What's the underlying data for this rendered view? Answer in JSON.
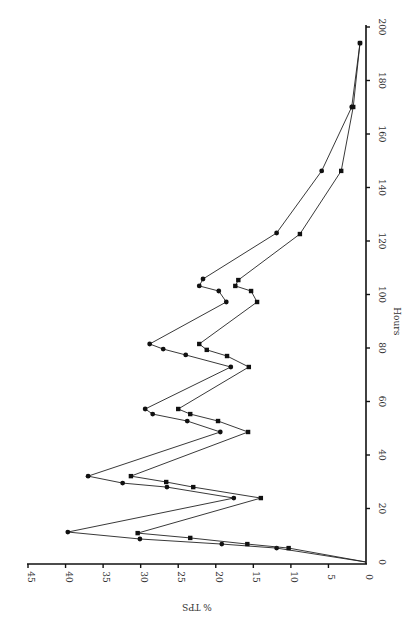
{
  "chart_data": {
    "type": "line",
    "orientation": "rotated-90-ccw",
    "title": "",
    "xlabel": "Hours",
    "ylabel": "% TPS",
    "xlim": [
      0,
      200
    ],
    "ylim": [
      0,
      45
    ],
    "x_ticks": [
      0,
      20,
      40,
      60,
      80,
      100,
      120,
      140,
      160,
      180,
      200
    ],
    "y_ticks": [
      0,
      5,
      10,
      15,
      20,
      25,
      30,
      35,
      40,
      45
    ],
    "grid": false,
    "legend": null,
    "series": [
      {
        "name": "Series A (circles)",
        "marker": "circle",
        "points": [
          [
            0,
            0
          ],
          [
            5.2,
            11.9
          ],
          [
            6.7,
            19.2
          ],
          [
            8.6,
            30.1
          ],
          [
            11.2,
            39.7
          ],
          [
            23.9,
            17.6
          ],
          [
            28.0,
            26.5
          ],
          [
            29.5,
            32.4
          ],
          [
            32.1,
            37.0
          ],
          [
            48.6,
            19.4
          ],
          [
            52.7,
            23.8
          ],
          [
            55.3,
            28.4
          ],
          [
            57.2,
            29.4
          ],
          [
            72.9,
            18.0
          ],
          [
            77.4,
            24.0
          ],
          [
            79.6,
            27.0
          ],
          [
            81.5,
            28.8
          ],
          [
            97.2,
            18.6
          ],
          [
            101.3,
            19.6
          ],
          [
            103.2,
            22.2
          ],
          [
            105.8,
            21.7
          ],
          [
            123.0,
            11.9
          ],
          [
            146.2,
            5.9
          ],
          [
            170.1,
            1.9
          ],
          [
            194.0,
            0.8
          ]
        ]
      },
      {
        "name": "Series B (squares)",
        "marker": "square",
        "points": [
          [
            0,
            0
          ],
          [
            5.2,
            10.3
          ],
          [
            6.7,
            15.8
          ],
          [
            9.0,
            23.4
          ],
          [
            10.8,
            30.4
          ],
          [
            23.9,
            14.0
          ],
          [
            28.0,
            23.0
          ],
          [
            29.9,
            26.6
          ],
          [
            32.1,
            31.3
          ],
          [
            48.6,
            15.7
          ],
          [
            52.7,
            19.7
          ],
          [
            55.3,
            23.4
          ],
          [
            57.2,
            25.0
          ],
          [
            72.9,
            15.6
          ],
          [
            77.0,
            18.5
          ],
          [
            79.3,
            21.2
          ],
          [
            81.5,
            22.2
          ],
          [
            97.2,
            14.5
          ],
          [
            101.3,
            15.3
          ],
          [
            103.2,
            17.4
          ],
          [
            105.4,
            17.0
          ],
          [
            122.6,
            8.8
          ],
          [
            146.2,
            3.3
          ],
          [
            170.1,
            1.7
          ],
          [
            194.0,
            0.8
          ]
        ]
      }
    ]
  },
  "axes": {
    "hours_label": "Hours",
    "tps_label": "% TPS"
  },
  "colors": {
    "ink": "#111111",
    "background": "#ffffff"
  }
}
